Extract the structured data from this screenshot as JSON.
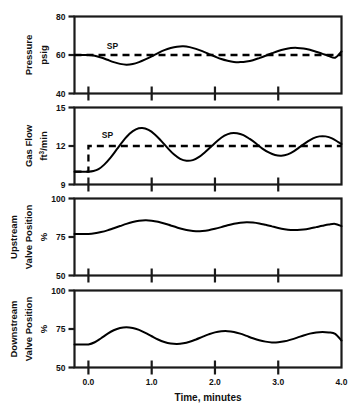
{
  "figure": {
    "width": 357,
    "height": 405,
    "background": "#ffffff",
    "ink_color": "#000000"
  },
  "xaxis": {
    "title": "Time, minutes",
    "ticks": [
      "0.0",
      "1.0",
      "2.0",
      "3.0",
      "4.0"
    ],
    "tick_values": [
      0,
      1,
      2,
      3,
      4
    ],
    "range": [
      -0.22,
      4.0
    ]
  },
  "panels": {
    "pressure": {
      "ylabel_line1": "Pressure",
      "ylabel_line2": "psig",
      "ticks": [
        "80",
        "60",
        "40"
      ],
      "sp_label": "SP"
    },
    "gasflow": {
      "ylabel_line1": "Gas Flow",
      "ylabel_line2_pre": "ft",
      "ylabel_line2_sup": "3",
      "ylabel_line2_post": "/min",
      "ticks": [
        "15",
        "12",
        "9"
      ],
      "sp_label": "SP"
    },
    "upstream": {
      "ylabel_line1": "Upstream",
      "ylabel_line2": "Valve Position",
      "ylabel_line3": "%",
      "ticks": [
        "100",
        "75",
        "50"
      ]
    },
    "downstream": {
      "ylabel_line1": "Downstream",
      "ylabel_line2": "Valve Position",
      "ylabel_line3": "%",
      "ticks": [
        "100",
        "75",
        "50"
      ]
    }
  },
  "chart_data": {
    "type": "line",
    "title": "",
    "xlabel": "Time, minutes",
    "subplots": [
      {
        "name": "pressure",
        "ylabel": "Pressure psig",
        "ylim": [
          40,
          80
        ],
        "yticks": [
          40,
          60,
          80
        ],
        "grid": false,
        "series": [
          {
            "name": "Pressure",
            "style": "solid",
            "x": [
              -0.22,
              -0.1,
              0.0,
              0.1,
              0.2,
              0.3,
              0.4,
              0.5,
              0.6,
              0.7,
              0.8,
              0.9,
              1.0,
              1.1,
              1.2,
              1.3,
              1.4,
              1.5,
              1.6,
              1.7,
              1.8,
              1.9,
              2.0,
              2.1,
              2.2,
              2.3,
              2.4,
              2.5,
              2.6,
              2.7,
              2.8,
              2.9,
              3.0,
              3.1,
              3.2,
              3.3,
              3.4,
              3.5,
              3.6,
              3.7,
              3.8,
              3.9,
              4.0
            ],
            "y": [
              60.0,
              60.0,
              60.0,
              59.6,
              58.7,
              57.5,
              56.3,
              55.4,
              55.0,
              55.3,
              56.3,
              57.7,
              59.3,
              61.0,
              62.5,
              63.6,
              64.3,
              64.5,
              64.1,
              63.2,
              62.0,
              60.6,
              59.2,
              57.9,
              57.0,
              56.4,
              56.3,
              56.6,
              57.3,
              58.4,
              59.6,
              60.9,
              62.1,
              63.0,
              63.6,
              63.7,
              63.4,
              62.7,
              61.7,
              60.6,
              59.5,
              58.6,
              61.8
            ]
          },
          {
            "name": "Setpoint",
            "style": "dashed",
            "value": 60,
            "x": [
              -0.22,
              4.0
            ],
            "y": [
              60,
              60
            ]
          }
        ],
        "annotations": [
          {
            "text": "SP",
            "x": 0.38,
            "y": 63.0
          }
        ]
      },
      {
        "name": "gasflow",
        "ylabel": "Gas Flow ft3/min",
        "ylim": [
          9,
          15
        ],
        "yticks": [
          9,
          12,
          15
        ],
        "grid": false,
        "series": [
          {
            "name": "Gas Flow",
            "style": "solid",
            "x": [
              -0.22,
              -0.1,
              0.0,
              0.08,
              0.16,
              0.25,
              0.35,
              0.45,
              0.55,
              0.65,
              0.75,
              0.85,
              0.95,
              1.05,
              1.15,
              1.25,
              1.35,
              1.45,
              1.55,
              1.65,
              1.75,
              1.85,
              1.95,
              2.05,
              2.15,
              2.25,
              2.35,
              2.45,
              2.55,
              2.65,
              2.75,
              2.85,
              2.95,
              3.05,
              3.15,
              3.25,
              3.35,
              3.45,
              3.55,
              3.65,
              3.75,
              3.85,
              3.95,
              4.0
            ],
            "y": [
              10.0,
              10.0,
              10.0,
              10.05,
              10.2,
              10.55,
              11.1,
              11.75,
              12.4,
              12.95,
              13.3,
              13.4,
              13.25,
              12.9,
              12.4,
              11.85,
              11.35,
              11.0,
              10.85,
              10.9,
              11.15,
              11.55,
              12.0,
              12.45,
              12.8,
              13.0,
              13.0,
              12.85,
              12.55,
              12.2,
              11.8,
              11.5,
              11.3,
              11.25,
              11.35,
              11.6,
              11.95,
              12.3,
              12.6,
              12.75,
              12.75,
              12.6,
              12.3,
              12.15
            ]
          },
          {
            "name": "Setpoint",
            "style": "dashed-step",
            "x": [
              -0.22,
              0.0,
              0.0,
              4.0
            ],
            "y": [
              10.0,
              10.0,
              12.0,
              12.0
            ]
          }
        ],
        "annotations": [
          {
            "text": "SP",
            "x": 0.3,
            "y": 12.6
          }
        ]
      },
      {
        "name": "upstream",
        "ylabel": "Upstream Valve Position %",
        "ylim": [
          50,
          100
        ],
        "yticks": [
          50,
          75,
          100
        ],
        "grid": false,
        "series": [
          {
            "name": "Upstream Valve Position",
            "style": "solid",
            "x": [
              -0.22,
              -0.1,
              0.0,
              0.1,
              0.2,
              0.3,
              0.4,
              0.5,
              0.6,
              0.7,
              0.8,
              0.9,
              1.0,
              1.1,
              1.2,
              1.3,
              1.4,
              1.5,
              1.6,
              1.7,
              1.8,
              1.9,
              2.0,
              2.1,
              2.2,
              2.3,
              2.4,
              2.5,
              2.6,
              2.7,
              2.8,
              2.9,
              3.0,
              3.1,
              3.2,
              3.3,
              3.4,
              3.5,
              3.6,
              3.7,
              3.8,
              3.9,
              4.0
            ],
            "y": [
              77.0,
              77.0,
              77.0,
              77.4,
              78.2,
              79.3,
              80.7,
              82.1,
              83.5,
              84.7,
              85.5,
              85.8,
              85.6,
              84.9,
              83.8,
              82.5,
              81.2,
              80.0,
              79.2,
              78.8,
              78.9,
              79.4,
              80.3,
              81.4,
              82.6,
              83.6,
              84.3,
              84.6,
              84.4,
              83.8,
              82.9,
              81.9,
              80.9,
              80.1,
              79.6,
              79.5,
              79.8,
              80.5,
              81.4,
              82.3,
              83.1,
              83.5,
              82.0
            ]
          }
        ],
        "annotations": []
      },
      {
        "name": "downstream",
        "ylabel": "Downstream Valve Position %",
        "ylim": [
          50,
          100
        ],
        "yticks": [
          50,
          75,
          100
        ],
        "grid": false,
        "series": [
          {
            "name": "Downstream Valve Position",
            "style": "solid",
            "x": [
              -0.22,
              -0.1,
              0.0,
              0.1,
              0.2,
              0.3,
              0.4,
              0.5,
              0.6,
              0.7,
              0.8,
              0.9,
              1.0,
              1.1,
              1.2,
              1.3,
              1.4,
              1.5,
              1.6,
              1.7,
              1.8,
              1.9,
              2.0,
              2.1,
              2.2,
              2.3,
              2.4,
              2.5,
              2.6,
              2.7,
              2.8,
              2.9,
              3.0,
              3.1,
              3.2,
              3.3,
              3.4,
              3.5,
              3.6,
              3.7,
              3.8,
              3.9,
              4.0
            ],
            "y": [
              65.0,
              65.0,
              65.0,
              66.4,
              69.0,
              71.8,
              74.2,
              75.7,
              76.2,
              75.7,
              74.4,
              72.5,
              70.3,
              68.2,
              66.6,
              65.6,
              65.3,
              65.7,
              66.7,
              68.2,
              69.9,
              71.5,
              72.8,
              73.5,
              73.6,
              73.1,
              72.0,
              70.5,
              69.0,
              67.7,
              66.8,
              66.3,
              66.4,
              67.0,
              68.1,
              69.4,
              70.8,
              72.0,
              72.8,
              73.1,
              72.8,
              71.8,
              67.5
            ]
          }
        ],
        "annotations": []
      }
    ]
  }
}
